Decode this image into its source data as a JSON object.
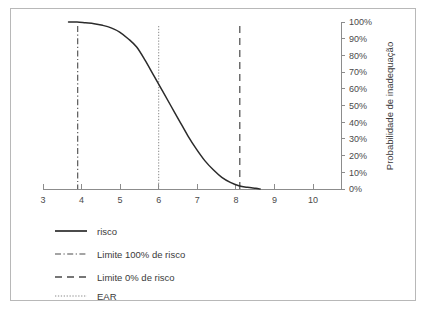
{
  "chart_data": {
    "type": "line",
    "title": "",
    "xlabel": "",
    "ylabel": "Probabilidade de inadequação",
    "xlim": [
      3,
      10
    ],
    "ylim": [
      0,
      100
    ],
    "grid": false,
    "legend_position": "below-plot",
    "x_ticks": [
      "3",
      "4",
      "5",
      "6",
      "7",
      "8",
      "9",
      "10"
    ],
    "x_tick_values": [
      3,
      4,
      5,
      6,
      7,
      8,
      9,
      10
    ],
    "y_ticks": [
      "0%",
      "10%",
      "20%",
      "30%",
      "40%",
      "50%",
      "60%",
      "70%",
      "80%",
      "90%",
      "100%"
    ],
    "y_tick_values": [
      0,
      10,
      20,
      30,
      40,
      50,
      60,
      70,
      80,
      90,
      100
    ],
    "y_axis_side": "right",
    "series": [
      {
        "name": "risco",
        "style": "solid",
        "color": "#2b2b2b",
        "x": [
          3.6,
          3.8,
          4.0,
          4.2,
          4.4,
          4.6,
          4.8,
          5.0,
          5.2,
          5.4,
          5.6,
          5.8,
          6.0,
          6.2,
          6.4,
          6.6,
          6.8,
          7.0,
          7.2,
          7.4,
          7.6,
          7.8,
          8.0,
          8.1
        ],
        "values": [
          100,
          100,
          99.5,
          99,
          98,
          96.5,
          94,
          90,
          85,
          77,
          68,
          59,
          50,
          41,
          32,
          24,
          17,
          11.5,
          7,
          4,
          2,
          1,
          0.4,
          0
        ]
      }
    ],
    "reference_lines": [
      {
        "name": "Limite 100% de risco",
        "orientation": "vertical",
        "x": 3.9,
        "style": "dash-dot",
        "color": "#4a4a4a"
      },
      {
        "name": "EAR",
        "orientation": "vertical",
        "x": 6.0,
        "style": "dotted",
        "color": "#8a8a8a"
      },
      {
        "name": "Limite 0% de risco",
        "orientation": "vertical",
        "x": 8.1,
        "style": "dashed",
        "color": "#4a4a4a"
      }
    ],
    "legend": [
      {
        "label": "risco",
        "style": "solid",
        "color": "#2b2b2b"
      },
      {
        "label": "Limite 100% de risco",
        "style": "dash-dot",
        "color": "#4a4a4a"
      },
      {
        "label": "Limite 0% de risco",
        "style": "dashed",
        "color": "#4a4a4a"
      },
      {
        "label": "EAR",
        "style": "dotted",
        "color": "#8a8a8a"
      }
    ]
  }
}
